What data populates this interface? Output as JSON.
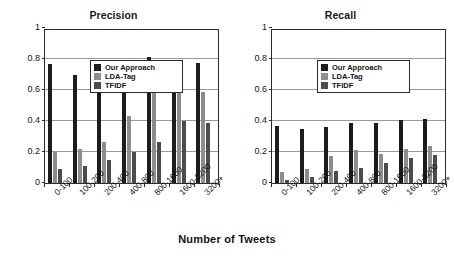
{
  "axis_caption": "Number of Tweets",
  "legend": {
    "entries": [
      {
        "label": "Our Approach",
        "color": "#1c1c1c"
      },
      {
        "label": "LDA-Tag",
        "color": "#8d8d8d"
      },
      {
        "label": "TFIDF",
        "color": "#4c4c4c"
      }
    ]
  },
  "yticks": [
    "1",
    "0.8",
    "0.6",
    "0.4",
    "0.2",
    "0"
  ],
  "chart_data": [
    {
      "type": "bar",
      "title": "Precision",
      "xlabel": "Number of Tweets",
      "ylabel": "",
      "ylim": [
        0,
        1
      ],
      "grid": true,
      "legend_position": "top-left",
      "yticks": [
        0,
        0.2,
        0.4,
        0.6,
        0.8,
        1
      ],
      "categories": [
        "0-100",
        "100-200",
        "200-400",
        "400-800",
        "800-1600",
        "1600-3200",
        "3200+"
      ],
      "series": [
        {
          "name": "Our Approach",
          "color": "#1c1c1c",
          "values": [
            0.77,
            0.695,
            0.72,
            0.71,
            0.81,
            0.795,
            0.775
          ]
        },
        {
          "name": "LDA-Tag",
          "color": "#8d8d8d",
          "values": [
            0.2,
            0.22,
            0.265,
            0.43,
            0.58,
            0.61,
            0.59
          ]
        },
        {
          "name": "TFIDF",
          "color": "#4c4c4c",
          "values": [
            0.09,
            0.11,
            0.15,
            0.2,
            0.265,
            0.4,
            0.385
          ]
        }
      ]
    },
    {
      "type": "bar",
      "title": "Recall",
      "xlabel": "Number of Tweets",
      "ylabel": "",
      "ylim": [
        0,
        1
      ],
      "grid": true,
      "legend_position": "top-left",
      "yticks": [
        0,
        0.2,
        0.4,
        0.6,
        0.8,
        1
      ],
      "categories": [
        "0-100",
        "100-200",
        "200-400",
        "400-800",
        "800-1600",
        "1600-3200",
        "3200+"
      ],
      "series": [
        {
          "name": "Our Approach",
          "color": "#1c1c1c",
          "values": [
            0.37,
            0.35,
            0.36,
            0.385,
            0.39,
            0.405,
            0.415
          ]
        },
        {
          "name": "LDA-Tag",
          "color": "#8d8d8d",
          "values": [
            0.07,
            0.09,
            0.175,
            0.215,
            0.19,
            0.22,
            0.24
          ]
        },
        {
          "name": "TFIDF",
          "color": "#4c4c4c",
          "values": [
            0.02,
            0.04,
            0.08,
            0.1,
            0.13,
            0.16,
            0.18
          ]
        }
      ]
    }
  ]
}
